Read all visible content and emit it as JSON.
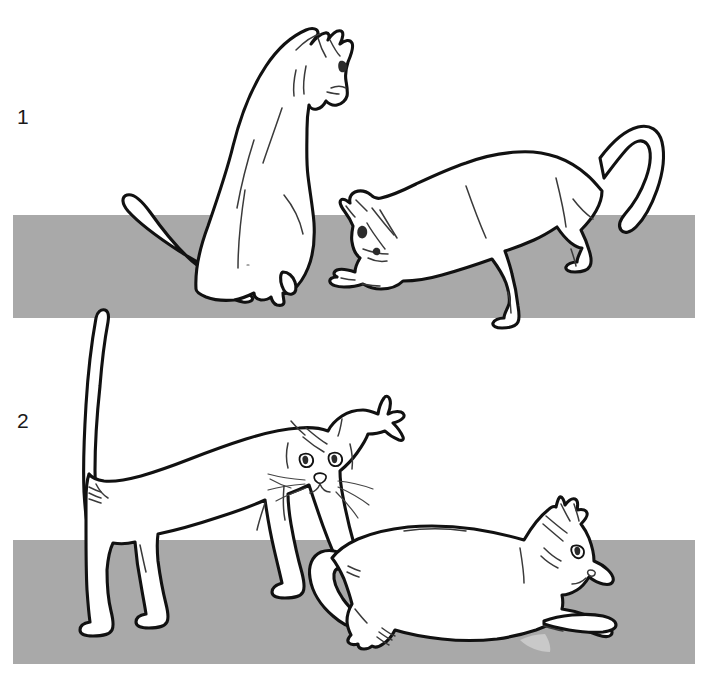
{
  "figure": {
    "background_color": "#ffffff",
    "width": 708,
    "height": 688,
    "ground_color": "#a9a9a9",
    "outline_color": "#111111",
    "body_fill": "#ffffff"
  },
  "panels": [
    {
      "label": "1",
      "label_x": 17,
      "label_y": 124,
      "ground": {
        "x": 13,
        "y": 215,
        "width": 682,
        "height": 103
      },
      "cats": [
        {
          "name": "sitting-cat",
          "pose": "sitting upright, head turned right, tail curled forward on ground"
        },
        {
          "name": "crouching-cat",
          "pose": "crouched low with head down, hindquarters raised, tail curved up"
        }
      ]
    },
    {
      "label": "2",
      "label_x": 17,
      "label_y": 428,
      "ground": {
        "x": 13,
        "y": 540,
        "width": 682,
        "height": 124
      },
      "cats": [
        {
          "name": "standing-cat",
          "pose": "standing, tail held straight up, head facing viewer with whiskers"
        },
        {
          "name": "lying-cat",
          "pose": "lying down on side with forepaws extended, head resting low, tail curled"
        }
      ]
    }
  ]
}
